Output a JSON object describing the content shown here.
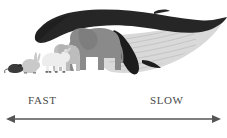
{
  "figure": {
    "axis": {
      "left_label": "FAST",
      "right_label": "SLOW",
      "arrow_style": "double-headed",
      "line_color": "#555555"
    },
    "animals": [
      {
        "name": "mouse",
        "label": "Mouse",
        "color": "#3b3b3b",
        "order": 1
      },
      {
        "name": "rabbit",
        "label": "Rabbit",
        "color": "#c9c9c9",
        "order": 2
      },
      {
        "name": "dog",
        "label": "Dog",
        "color": "#ededed",
        "order": 3
      },
      {
        "name": "elephant-calf",
        "label": "Elephant calf",
        "color": "#bdbdbd",
        "order": 4
      },
      {
        "name": "elephant",
        "label": "Elephant",
        "color": "#8a8a8a",
        "order": 5
      },
      {
        "name": "whale",
        "label": "Humpback whale",
        "color": "#262626",
        "order": 6
      }
    ],
    "colors": {
      "background": "#ffffff",
      "whale_body": "#262626",
      "whale_belly": "#d9d9d9",
      "whale_groove": "#bfbfbf",
      "elephant": "#8a8a8a",
      "elephant_calf": "#bdbdbd",
      "dog": "#ededed",
      "rabbit": "#c9c9c9",
      "mouse": "#3b3b3b",
      "text": "#4a4a4a",
      "arrow": "#555555"
    }
  }
}
